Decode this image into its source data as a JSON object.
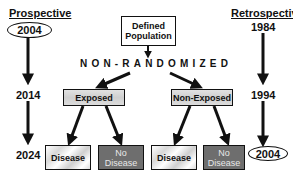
{
  "diagram": {
    "type": "cohort-study-design",
    "prospective": {
      "header": "Prospective",
      "start_year": "2004",
      "mid_year": "2014",
      "end_year": "2024"
    },
    "retrospective": {
      "header": "Retrospective",
      "start_year": "1984",
      "mid_year": "1994",
      "end_year": "2004"
    },
    "population": {
      "line1": "Defined",
      "line2": "Population"
    },
    "assignment_label": "NON-RANDOMIZED",
    "groups": [
      {
        "label": "Exposed",
        "outcomes": [
          {
            "line1": "Disease",
            "line2": ""
          },
          {
            "line1": "No",
            "line2": "Disease"
          }
        ]
      },
      {
        "label": "Non-Exposed",
        "outcomes": [
          {
            "line1": "Disease",
            "line2": ""
          },
          {
            "line1": "No",
            "line2": "Disease"
          }
        ]
      }
    ],
    "colors": {
      "line": "#111111",
      "group_box": "#d6d6d6",
      "disease_box": "#eeeeee",
      "no_disease_box": "#6e6e6e"
    }
  }
}
